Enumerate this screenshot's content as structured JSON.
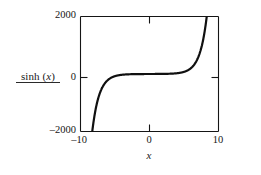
{
  "figure": {
    "background_color": "#ffffff",
    "ink_color": "#101010"
  },
  "axis_label_y": {
    "text_prefix": "sinh (",
    "text_variable": "x",
    "text_suffix": ")",
    "full_text": "sinh (x)",
    "has_underline_rule": true
  },
  "axis_label_x": {
    "full_text": "x"
  },
  "ticks": {
    "y": [
      {
        "value": 2000,
        "label": "2000"
      },
      {
        "value": 0,
        "label": "0"
      },
      {
        "value": -2000,
        "label": "–2000"
      }
    ],
    "x": [
      {
        "value": -10,
        "label": "–10"
      },
      {
        "value": 0,
        "label": "0"
      },
      {
        "value": 10,
        "label": "10"
      }
    ]
  },
  "chart_data": {
    "type": "line",
    "title": "",
    "subtitle": "",
    "xlabel": "x",
    "ylabel": "sinh (x)",
    "xlim": [
      -10,
      10
    ],
    "ylim": [
      -2000,
      2000
    ],
    "grid": false,
    "legend": null,
    "legend_position": "none",
    "xticks": [
      -10,
      0,
      10
    ],
    "xticklabels": [
      "–10",
      "0",
      "10"
    ],
    "yticks": [
      -2000,
      0,
      2000
    ],
    "yticklabels": [
      "2000",
      "0",
      "–2000"
    ],
    "axis_style": "box-frame-with-inward-ticks",
    "line_color": "#101010",
    "line_width": 2.2,
    "series": [
      {
        "name": "sinh(x)",
        "function": "y = sinh(x)",
        "clipped_to_ylim": true,
        "x": [
          -10,
          -9.5,
          -9,
          -8.7,
          -8.5,
          -8,
          -7.5,
          -7,
          -6.5,
          -6,
          -5.5,
          -5,
          -4.5,
          -4,
          -3.5,
          -3,
          -2.5,
          -2,
          -1.5,
          -1,
          -0.5,
          0,
          0.5,
          1,
          1.5,
          2,
          2.5,
          3,
          3.5,
          4,
          4.5,
          5,
          5.5,
          6,
          6.5,
          7,
          7.5,
          8,
          8.5,
          8.7,
          9,
          9.5,
          10
        ],
        "values": [
          -11013,
          -6680,
          -4052,
          -3001,
          -2459,
          -1490,
          -904,
          -548,
          -332,
          -202,
          -122,
          -74.2,
          -45.0,
          -27.3,
          -16.5,
          -10.0,
          -6.05,
          -3.63,
          -2.13,
          -1.18,
          -0.521,
          0,
          0.521,
          1.18,
          2.13,
          3.63,
          6.05,
          10.0,
          16.5,
          27.3,
          45.0,
          74.2,
          122,
          202,
          332,
          548,
          904,
          1490,
          2459,
          3001,
          4052,
          6680,
          11013
        ]
      }
    ],
    "annotations": [
      {
        "text": "curve exits bottom frame near x = –8.7",
        "visible": false
      },
      {
        "text": "curve exits top frame near x = 8.7",
        "visible": false
      }
    ]
  }
}
